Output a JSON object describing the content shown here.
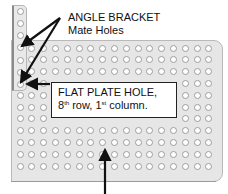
{
  "diagram": {
    "labels": {
      "bracket_title": "ANGLE BRACKET",
      "bracket_sub": "Mate Holes",
      "plate_line1": "FLAT PLATE HOLE,",
      "plate_line2_num": "8",
      "plate_line2_sup1": "th",
      "plate_line2_mid": " row, 1",
      "plate_line2_sup2": "st",
      "plate_line2_end": " column."
    },
    "flat_plate": {
      "rows": 11,
      "cols": 17,
      "first_hole_x": 20,
      "first_hole_y": 48,
      "pitch": 11.8,
      "color": "#e6e6e6"
    },
    "angle_bracket": {
      "holes": 7,
      "hole_x": 20,
      "first_hole_y": 11,
      "pitch": 12.3,
      "color": "#e9e9e9"
    },
    "arrows": [
      {
        "name": "bracket-arrow-upper",
        "from": [
          60,
          18
        ],
        "to": [
          22,
          46
        ]
      },
      {
        "name": "bracket-arrow-lower",
        "from": [
          60,
          18
        ],
        "to": [
          21,
          82
        ]
      },
      {
        "name": "flat-plate-arrow",
        "from": [
          50,
          84
        ],
        "to": [
          27,
          84
        ]
      },
      {
        "name": "bottom-arrow",
        "from": [
          105,
          194
        ],
        "to": [
          105,
          150
        ]
      }
    ]
  }
}
